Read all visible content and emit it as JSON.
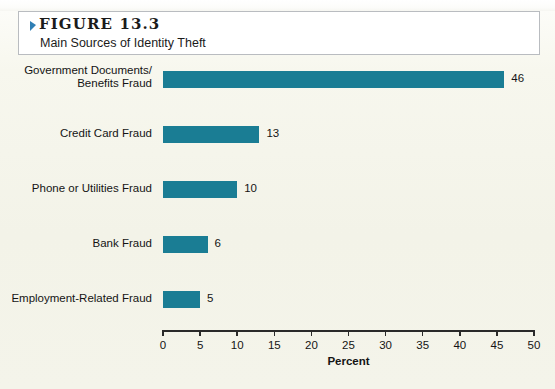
{
  "figure": {
    "number_label": "FIGURE 13.3",
    "subtitle": "Main Sources of Identity Theft",
    "marker_icon": "triangle-marker-icon",
    "marker_color": "#2f7fb5"
  },
  "colors": {
    "bar": "#1a7d94",
    "page_background": "#f3f3e8",
    "title_box_background": "#ffffff",
    "title_box_border": "#b9bcc0",
    "axis": "#2a2a2a",
    "text": "#141414"
  },
  "chart_data": {
    "type": "bar",
    "orientation": "horizontal",
    "title": "Main Sources of Identity Theft",
    "categories": [
      "Government Documents/ Benefits Fraud",
      "Credit Card Fraud",
      "Phone or Utilities Fraud",
      "Bank Fraud",
      "Employment-Related Fraud"
    ],
    "category_lines": [
      [
        "Government Documents/",
        "Benefits Fraud"
      ],
      [
        "Credit Card Fraud"
      ],
      [
        "Phone or Utilities Fraud"
      ],
      [
        "Bank Fraud"
      ],
      [
        "Employment-Related Fraud"
      ]
    ],
    "values": [
      46,
      13,
      10,
      6,
      5
    ],
    "value_labels": [
      "46",
      "13",
      "10",
      "6",
      "5"
    ],
    "xlabel": "Percent",
    "ylabel": "",
    "xlim": [
      0,
      50
    ],
    "xticks": [
      0,
      5,
      10,
      15,
      20,
      25,
      30,
      35,
      40,
      45,
      50
    ],
    "xtick_labels": [
      "0",
      "5",
      "10",
      "15",
      "20",
      "25",
      "30",
      "35",
      "40",
      "45",
      "50"
    ],
    "grid": false,
    "legend": null
  }
}
